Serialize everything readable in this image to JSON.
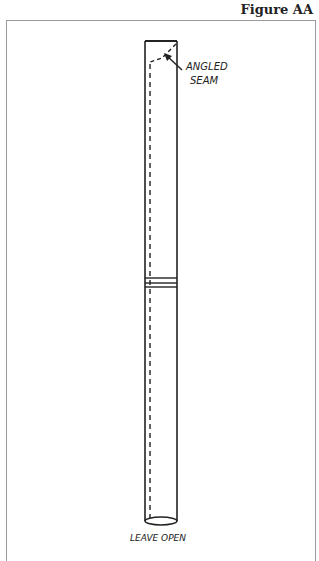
{
  "figure": {
    "title": "Figure AA",
    "labels": {
      "seam_line1": "ANGLED",
      "seam_line2": "SEAM",
      "bottom": "LEAVE OPEN"
    }
  },
  "colors": {
    "ink": "#222222",
    "frame": "#9a9a9a"
  }
}
